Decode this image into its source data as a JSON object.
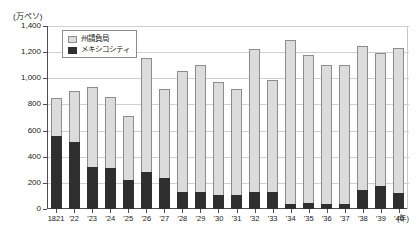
{
  "chart_data": {
    "type": "bar",
    "stacked": true,
    "title": "",
    "subtitle": "",
    "unit_label": "(万ペソ)",
    "xlabel": "(年)",
    "ylabel": "",
    "ylim": [
      0,
      1400
    ],
    "ytick_values": [
      0,
      200,
      400,
      600,
      800,
      1000,
      1200,
      1400
    ],
    "ytick_labels": [
      "0",
      "200",
      "400",
      "600",
      "800",
      "1,000",
      "1,200",
      "1,400"
    ],
    "grid": true,
    "legend_position": "top-left",
    "categories": [
      "1821",
      "'22",
      "'23",
      "'24",
      "'25",
      "'26",
      "'27",
      "'28",
      "'29",
      "'30",
      "'31",
      "'32",
      "'33",
      "'34",
      "'35",
      "'36",
      "'37",
      "'38",
      "'39",
      "'40"
    ],
    "series": [
      {
        "name": "メキシコシティ",
        "color": "#2f2f2f",
        "values": [
          555,
          510,
          320,
          310,
          225,
          280,
          235,
          130,
          130,
          105,
          105,
          130,
          130,
          40,
          45,
          40,
          35,
          145,
          175,
          120
        ]
      },
      {
        "name": "州請負局",
        "color": "#dcdcdc",
        "values": [
          295,
          390,
          610,
          545,
          485,
          875,
          685,
          925,
          970,
          870,
          815,
          1095,
          855,
          1250,
          1130,
          1065,
          1070,
          1105,
          1020,
          1110
        ]
      }
    ],
    "totals": [
      850,
      900,
      930,
      855,
      710,
      1155,
      920,
      1055,
      1100,
      975,
      920,
      1225,
      985,
      1290,
      1175,
      1105,
      1105,
      1250,
      1195,
      1230
    ]
  },
  "legend": {
    "items": [
      {
        "label": "州請負局",
        "swatch": "light"
      },
      {
        "label": "メキシコシティ",
        "swatch": "dark"
      }
    ]
  }
}
